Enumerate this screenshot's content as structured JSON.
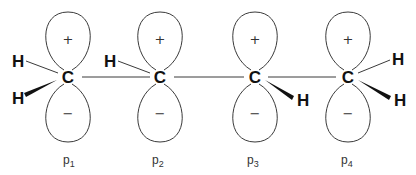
{
  "diagram": {
    "title": "",
    "carbons": [
      {
        "label": "C",
        "orbital": "p",
        "subscript": "1",
        "top_sign": "+",
        "bottom_sign": "−"
      },
      {
        "label": "C",
        "orbital": "p",
        "subscript": "2",
        "top_sign": "+",
        "bottom_sign": "−"
      },
      {
        "label": "C",
        "orbital": "p",
        "subscript": "3",
        "top_sign": "+",
        "bottom_sign": "−"
      },
      {
        "label": "C",
        "orbital": "p",
        "subscript": "4",
        "top_sign": "+",
        "bottom_sign": "−"
      }
    ],
    "hydrogens": {
      "c1_upper": "H",
      "c1_lower": "H",
      "c2_upper": "H",
      "c3_lower": "H",
      "c4_upper": "H",
      "c4_lower": "H"
    }
  }
}
